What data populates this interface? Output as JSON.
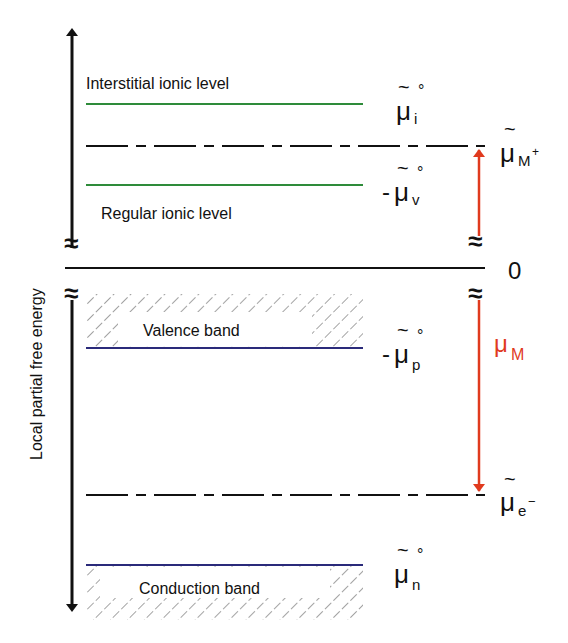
{
  "diagram": {
    "axis_label": "Local partial free energy",
    "colors": {
      "ionic_level": "#2e8b3a",
      "band_edge": "#2a2a7a",
      "chemical_potential_arrow": "#e03a1e",
      "reference_line": "#111111"
    },
    "levels": {
      "interstitial": {
        "label": "Interstitial ionic level",
        "symbol": "μ",
        "tilde": "~",
        "sup": "°",
        "sub": "i",
        "prefix": ""
      },
      "mu_M_plus": {
        "symbol": "μ",
        "tilde": "~",
        "sub": "M",
        "sup": "+",
        "prefix": ""
      },
      "regular": {
        "label": "Regular ionic level",
        "symbol": "μ",
        "tilde": "~",
        "sup": "°",
        "sub": "v",
        "prefix": "-"
      },
      "zero": {
        "label": "0"
      },
      "valence": {
        "label": "Valence band",
        "symbol": "μ",
        "tilde": "~",
        "sup": "°",
        "sub": "p",
        "prefix": "-"
      },
      "mu_e_minus": {
        "symbol": "μ",
        "tilde": "~",
        "sub": "e",
        "sup": "−",
        "prefix": ""
      },
      "conduction": {
        "label": "Conduction band",
        "symbol": "μ",
        "tilde": "~",
        "sup": "°",
        "sub": "n",
        "prefix": ""
      }
    },
    "mu_M": {
      "symbol": "μ",
      "sub": "M"
    },
    "break_symbol": "≈"
  }
}
